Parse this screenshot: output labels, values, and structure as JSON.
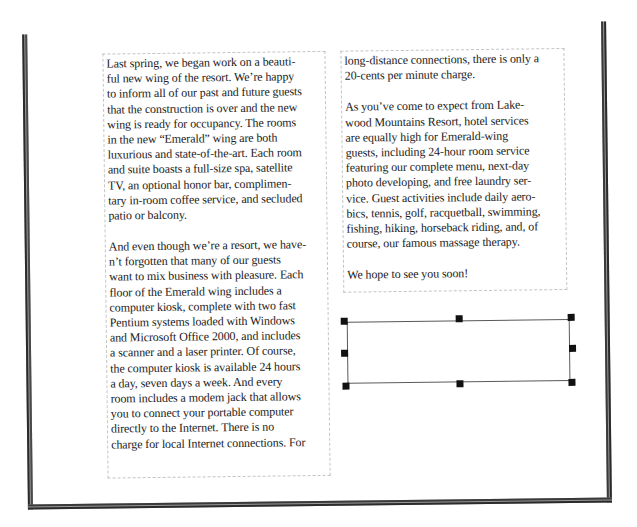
{
  "document": {
    "left_column": {
      "paragraphs": [
        {
          "lines": [
            "Last spring, we began work on a beauti-",
            "ful new wing of the resort. We’re happy",
            "to inform all of our past and future guests",
            "that the construction is over and the new",
            "wing is ready for occupancy. The rooms",
            "in the new “Emerald” wing are both",
            "luxurious and state-of-the-art. Each room",
            "and suite boasts a full-size spa,  satellite",
            "TV, an optional honor bar, complimen-",
            "tary in-room coffee service, and secluded",
            "patio or balcony."
          ]
        },
        {
          "lines": [
            "And even though we’re a resort, we have-",
            "n’t forgotten that many of our guests",
            "want to mix business with pleasure. Each",
            "floor of the Emerald wing includes a",
            "computer kiosk, complete with two fast",
            "Pentium systems loaded with Windows",
            "and Microsoft Office 2000, and includes",
            "a scanner and a laser printer. Of course,",
            "the computer kiosk is available 24 hours",
            "a day, seven days a week. And every",
            "room includes a modem jack that allows",
            "you to connect your portable computer",
            "directly to the Internet. There is no",
            "charge for local Internet connections. For"
          ]
        }
      ]
    },
    "right_column": {
      "paragraphs": [
        {
          "lines": [
            "long-distance connections, there is only a",
            "20-cents per minute charge."
          ]
        },
        {
          "lines": [
            "As you’ve come to expect from Lake-",
            "wood Mountains Resort, hotel services",
            "are equally high for Emerald-wing",
            "guests, including 24-hour room service",
            "featuring our complete menu, next-day",
            "photo developing, and free laundry ser-",
            "vice. Guest activities include daily aero-",
            "bics, tennis, golf, racquetball, swimming,",
            "fishing, hiking, horseback riding, and, of",
            "course, our famous massage therapy."
          ]
        },
        {
          "lines": [
            "We hope to see you soon!"
          ]
        }
      ]
    },
    "selected_text_box": {
      "content": "",
      "handles": [
        "top-left",
        "top-middle",
        "top-right",
        "middle-left",
        "middle-right",
        "bottom-left",
        "bottom-middle",
        "bottom-right"
      ]
    }
  },
  "colors": {
    "frame_border": "#c4c4c4",
    "page_edge": "#2b2b2b",
    "handle": "#111111",
    "text": "#1b1b1b"
  }
}
